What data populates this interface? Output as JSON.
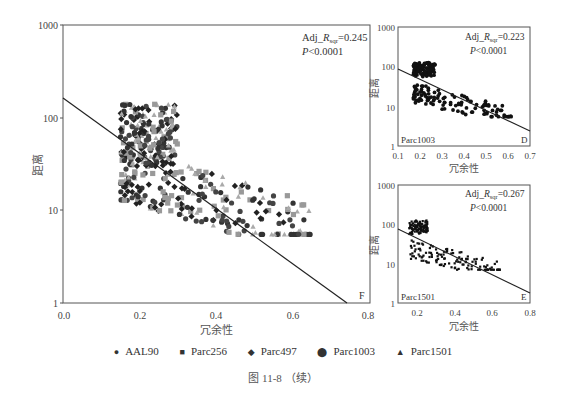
{
  "chart_data": [
    {
      "panel": "F",
      "type": "scatter",
      "xlabel": "冗余性",
      "ylabel": "距离",
      "xlim": [
        0.0,
        0.8
      ],
      "ylim": [
        1,
        1000
      ],
      "yscale": "log",
      "xticks": [
        "0.0",
        "0.2",
        "0.4",
        "0.6",
        "0.8"
      ],
      "yticks": [
        "1",
        "10",
        "100",
        "1000"
      ],
      "annotation_r": "Adj_R_sqr=0.245",
      "annotation_p": "P<0.0001",
      "panel_label": "F",
      "fit_line": {
        "x": [
          0.0,
          0.74
        ],
        "y": [
          150,
          1
        ]
      },
      "series": [
        {
          "name": "AAL90",
          "marker": "circle-small"
        },
        {
          "name": "Parc256",
          "marker": "square"
        },
        {
          "name": "Parc497",
          "marker": "diamond"
        },
        {
          "name": "Parc1003",
          "marker": "circle"
        },
        {
          "name": "Parc1501",
          "marker": "triangle"
        }
      ],
      "point_cloud": {
        "x_range": [
          0.13,
          0.66
        ],
        "y_range": [
          5.5,
          140
        ],
        "note": "dense cluster at x 0.15-0.3, y 60-140; lower band x 0.2-0.5, y 6-15"
      }
    },
    {
      "panel": "D",
      "type": "scatter",
      "xlabel": "冗余性",
      "ylabel": "距离",
      "xlim": [
        0.1,
        0.7
      ],
      "ylim": [
        1,
        1000
      ],
      "yscale": "log",
      "xticks": [
        "0.1",
        "0.2",
        "0.3",
        "0.4",
        "0.5",
        "0.6",
        "0.7"
      ],
      "yticks": [
        "1",
        "10",
        "100",
        "1000"
      ],
      "annotation_r": "Adj_R_sqr=0.223",
      "annotation_p": "P<0.0001",
      "series_label": "Parc1003",
      "panel_label": "D",
      "fit_line": {
        "x": [
          0.1,
          0.7
        ],
        "y": [
          80,
          2.7
        ]
      }
    },
    {
      "panel": "E",
      "type": "scatter",
      "xlabel": "冗余性",
      "ylabel": "距离",
      "xlim": [
        0.1,
        0.8
      ],
      "ylim": [
        1,
        1000
      ],
      "yscale": "log",
      "xticks": [
        "0.2",
        "0.4",
        "0.6",
        "0.8"
      ],
      "yticks": [
        "1",
        "10",
        "100",
        "1000"
      ],
      "annotation_r": "Adj_R_sqr=0.267",
      "annotation_p": "P<0.0001",
      "series_label": "Parc1501",
      "panel_label": "E",
      "fit_line": {
        "x": [
          0.1,
          0.8
        ],
        "y": [
          70,
          1.9
        ]
      }
    }
  ],
  "labels": {
    "xlabel": "冗余性",
    "ylabel": "距离",
    "main_r": "Adj_",
    "r_sym": "R",
    "r_sub": "sqr",
    "main_r_val": "=0.245",
    "main_p": "P",
    "main_p_val": "<0.0001",
    "d_r_val": "=0.223",
    "e_r_val": "=0.267",
    "p_val": "<0.0001",
    "f_label": "F",
    "d_label": "D",
    "e_label": "E",
    "d_series": "Parc1003",
    "e_series": "Parc1501"
  },
  "legend": [
    {
      "glyph": "●",
      "label": "AAL90"
    },
    {
      "glyph": "■",
      "label": "Parc256"
    },
    {
      "glyph": "◆",
      "label": "Parc497"
    },
    {
      "glyph": "⬤",
      "label": "Parc1003"
    },
    {
      "glyph": "▲",
      "label": "Parc1501"
    }
  ],
  "caption": "图 11-8 （续）"
}
